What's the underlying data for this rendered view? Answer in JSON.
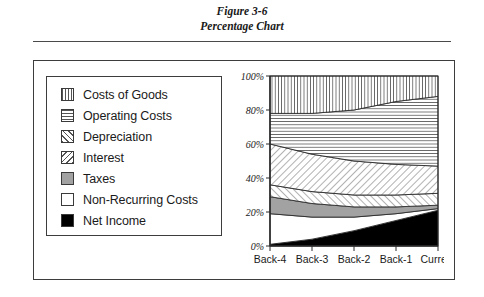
{
  "figure": {
    "caption_line1": "Figure 3-6",
    "caption_line2": "Percentage Chart"
  },
  "legend": {
    "items": [
      {
        "label": "Costs of Goods",
        "pattern": "vertical-hatch"
      },
      {
        "label": "Operating Costs",
        "pattern": "horizontal-hatch"
      },
      {
        "label": "Depreciation",
        "pattern": "forward-diagonal-hatch"
      },
      {
        "label": "Interest",
        "pattern": "back-diagonal-hatch"
      },
      {
        "label": "Taxes",
        "pattern": "solid-gray"
      },
      {
        "label": "Non-Recurring Costs",
        "pattern": "solid-white"
      },
      {
        "label": "Net Income",
        "pattern": "solid-black"
      }
    ]
  },
  "colors": {
    "taxes_gray": "#a2a2a2",
    "net_income_black": "#000000",
    "non_recurring_white": "#ffffff",
    "hatch_line": "#555555",
    "frame": "#3d3d3d"
  },
  "chart_data": {
    "type": "area",
    "title": "Percentage Chart",
    "xlabel": "",
    "ylabel": "",
    "categories": [
      "Back-4",
      "Back-3",
      "Back-2",
      "Back-1",
      "Current"
    ],
    "ytick_labels": [
      "0%",
      "20%",
      "40%",
      "60%",
      "80%",
      "100%"
    ],
    "ytick_values": [
      0,
      20,
      40,
      60,
      80,
      100
    ],
    "ylim": [
      0,
      100
    ],
    "stacked": true,
    "normalized_percent": true,
    "grid": false,
    "legend_position": "left",
    "series": [
      {
        "name": "Net Income",
        "values": [
          1,
          4,
          9,
          15,
          21
        ]
      },
      {
        "name": "Non-Recurring Costs",
        "values": [
          18,
          13,
          8,
          4,
          1
        ]
      },
      {
        "name": "Taxes",
        "values": [
          10,
          8,
          6,
          4,
          2
        ]
      },
      {
        "name": "Interest",
        "values": [
          7,
          7,
          7,
          7,
          7
        ]
      },
      {
        "name": "Depreciation",
        "values": [
          24,
          22,
          20,
          18,
          16
        ]
      },
      {
        "name": "Operating Costs",
        "values": [
          18,
          24,
          30,
          37,
          41
        ]
      },
      {
        "name": "Costs of Goods",
        "values": [
          22,
          22,
          20,
          15,
          12
        ]
      }
    ]
  }
}
